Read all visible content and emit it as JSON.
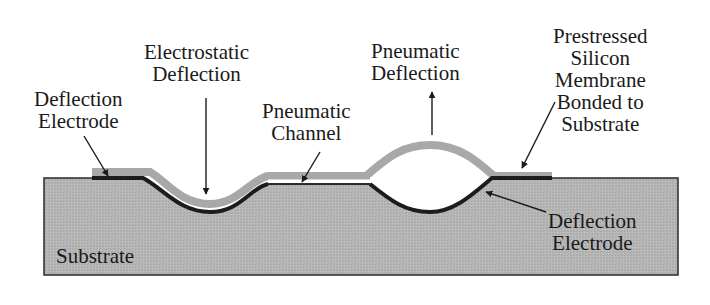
{
  "diagram": {
    "labels": {
      "deflection_electrode_left": [
        "Deflection",
        "Electrode"
      ],
      "electrostatic_deflection": [
        "Electrostatic",
        "Deflection"
      ],
      "pneumatic_channel": [
        "Pneumatic",
        "Channel"
      ],
      "pneumatic_deflection": [
        "Pneumatic",
        "Deflection"
      ],
      "membrane": [
        "Prestressed",
        "Silicon",
        "Membrane",
        "Bonded to",
        "Substrate"
      ],
      "deflection_electrode_right": [
        "Deflection",
        "Electrode"
      ],
      "substrate": "Substrate"
    },
    "colors": {
      "substrate_fill": "#b4b4b4",
      "membrane_fill": "#aaaaaa",
      "electrode": "#1c1c1c",
      "outline": "#2a2a2a",
      "text": "#1a1a1a",
      "background": "#ffffff"
    }
  }
}
